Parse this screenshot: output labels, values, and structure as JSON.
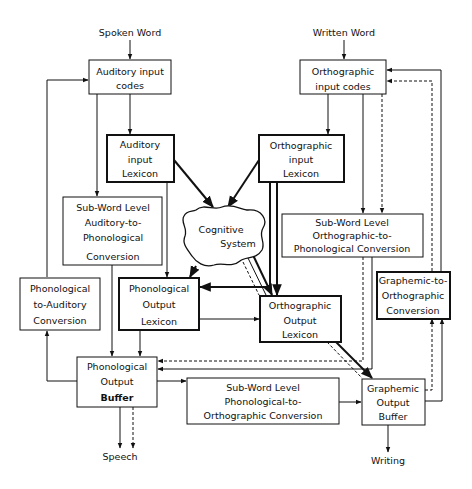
{
  "diagram": {
    "type": "cognitive model of spoken and written word processing",
    "inputs": {
      "spoken_word": "Spoken Word",
      "written_word": "Written Word"
    },
    "outputs": {
      "speech": "Speech",
      "writing": "Writing"
    },
    "nodes": {
      "auditory_input_codes": [
        "Auditory input",
        "codes"
      ],
      "auditory_input_lexicon": [
        "Auditory",
        "input",
        "Lexicon"
      ],
      "subword_auditory_to_phonological": [
        "Sub-Word Level",
        "Auditory-to-",
        "Phonological",
        "Conversion"
      ],
      "phonological_to_auditory": [
        "Phonological",
        "to-Auditory",
        "Conversion"
      ],
      "phonological_output_lexicon": [
        "Phonological",
        "Output",
        "Lexicon"
      ],
      "phonological_output_buffer": [
        "Phonological",
        "Output",
        "Buffer"
      ],
      "orthographic_input_codes": [
        "Orthographic",
        "input codes"
      ],
      "orthographic_input_lexicon": [
        "Orthographic",
        "input",
        "Lexicon"
      ],
      "cognitive_system": [
        "Cognitive",
        "System"
      ],
      "subword_orthographic_to_phonological": [
        "Sub-Word Level",
        "Orthographic-to-",
        "Phonological Conversion"
      ],
      "graphemic_to_orthographic": [
        "Graphemic-to-",
        "Orthographic",
        "Conversion"
      ],
      "orthographic_output_lexicon": [
        "Orthographic",
        "Output",
        "Lexicon"
      ],
      "subword_phonological_to_orthographic": [
        "Sub-Word Level",
        "Phonological-to-",
        "Orthographic Conversion"
      ],
      "graphemic_output_buffer": [
        "Graphemic",
        "Output",
        "Buffer"
      ]
    },
    "edges": [
      {
        "from": "Spoken Word",
        "to": "Auditory input codes",
        "style": "solid"
      },
      {
        "from": "Auditory input codes",
        "to": "Auditory input Lexicon",
        "style": "solid"
      },
      {
        "from": "Auditory input codes",
        "to": "Sub-Word Level Auditory-to-Phonological Conversion",
        "style": "solid"
      },
      {
        "from": "Auditory input Lexicon",
        "to": "Cognitive System",
        "style": "thick"
      },
      {
        "from": "Auditory input Lexicon",
        "to": "Phonological Output Lexicon",
        "style": "solid"
      },
      {
        "from": "Sub-Word Level Auditory-to-Phonological Conversion",
        "to": "Phonological Output Buffer",
        "style": "solid"
      },
      {
        "from": "Phonological Output Buffer",
        "to": "Phonological to-Auditory Conversion",
        "style": "solid"
      },
      {
        "from": "Phonological to-Auditory Conversion",
        "to": "Auditory input codes",
        "style": "solid"
      },
      {
        "from": "Phonological Output Lexicon",
        "to": "Phonological Output Buffer",
        "style": "solid"
      },
      {
        "from": "Phonological Output Lexicon",
        "to": "Orthographic Output Lexicon",
        "style": "solid"
      },
      {
        "from": "Orthographic input Lexicon",
        "to": "Phonological Output Lexicon",
        "style": "thick"
      },
      {
        "from": "Cognitive System",
        "to": "Phonological Output Lexicon",
        "style": "thick"
      },
      {
        "from": "Cognitive System",
        "to": "Orthographic Output Lexicon",
        "style": "thick-dashed"
      },
      {
        "from": "Written Word",
        "to": "Orthographic input codes",
        "style": "solid"
      },
      {
        "from": "Orthographic input codes",
        "to": "Orthographic input Lexicon",
        "style": "solid"
      },
      {
        "from": "Orthographic input codes",
        "to": "Sub-Word Level Orthographic-to-Phonological Conversion",
        "style": "solid"
      },
      {
        "from": "Orthographic input codes",
        "to": "Sub-Word Level Orthographic-to-Phonological Conversion",
        "style": "dashed"
      },
      {
        "from": "Orthographic input Lexicon",
        "to": "Cognitive System",
        "style": "thick"
      },
      {
        "from": "Orthographic input Lexicon",
        "to": "Orthographic Output Lexicon",
        "style": "thick"
      },
      {
        "from": "Sub-Word Level Orthographic-to-Phonological Conversion",
        "to": "Phonological Output Buffer",
        "style": "solid"
      },
      {
        "from": "Sub-Word Level Orthographic-to-Phonological Conversion",
        "to": "Phonological Output Buffer",
        "style": "dashed"
      },
      {
        "from": "Phonological Output Buffer",
        "to": "Sub-Word Level Phonological-to-Orthographic Conversion",
        "style": "solid"
      },
      {
        "from": "Sub-Word Level Phonological-to-Orthographic Conversion",
        "to": "Graphemic Output Buffer",
        "style": "solid"
      },
      {
        "from": "Orthographic Output Lexicon",
        "to": "Graphemic Output Buffer",
        "style": "thick-dashed"
      },
      {
        "from": "Graphemic Output Buffer",
        "to": "Graphemic-to-Orthographic Conversion",
        "style": "solid"
      },
      {
        "from": "Graphemic Output Buffer",
        "to": "Graphemic-to-Orthographic Conversion",
        "style": "dashed"
      },
      {
        "from": "Graphemic-to-Orthographic Conversion",
        "to": "Orthographic input codes",
        "style": "solid"
      },
      {
        "from": "Graphemic-to-Orthographic Conversion",
        "to": "Orthographic input codes",
        "style": "dashed"
      },
      {
        "from": "Phonological Output Buffer",
        "to": "Speech",
        "style": "solid"
      },
      {
        "from": "Phonological Output Buffer",
        "to": "Speech",
        "style": "dashed"
      },
      {
        "from": "Graphemic Output Buffer",
        "to": "Writing",
        "style": "solid"
      }
    ]
  }
}
